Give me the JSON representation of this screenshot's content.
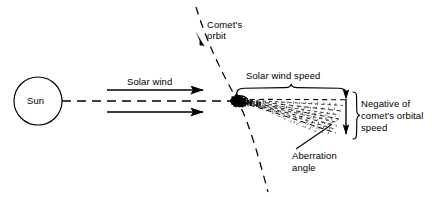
{
  "diagram": {
    "type": "schematic",
    "colors": {
      "ink": "#000000",
      "background": "#ffffff"
    },
    "labels": {
      "sun": "Sun",
      "solar_wind": "Solar wind",
      "comet_orbit_line1": "Comet's",
      "comet_orbit_line2": "orbit",
      "solar_wind_speed": "Solar wind speed",
      "negative_line1": "Negative of",
      "negative_line2": "comet's orbital",
      "negative_line3": "speed",
      "aberration_line1": "Aberration",
      "aberration_line2": "angle"
    },
    "elements": {
      "sun_circle": {
        "name": "sun-circle",
        "cx": 38,
        "cy": 101,
        "r": 24
      },
      "radial_dashed_line": {
        "name": "sun-comet-radial-line",
        "x1": 62,
        "y1": 101,
        "x2": 236,
        "y2": 101
      },
      "solar_wind_arrow_upper": {
        "name": "solar-wind-arrow-upper",
        "x1": 107,
        "y1": 90,
        "x2": 206,
        "y2": 90
      },
      "solar_wind_arrow_lower": {
        "name": "solar-wind-arrow-lower",
        "x1": 107,
        "y1": 112,
        "x2": 206,
        "y2": 112
      },
      "comet_orbit_curve": {
        "name": "comet-orbit-curve",
        "start": [
          196,
          7
        ],
        "through": [
          237,
          100
        ],
        "end": [
          268,
          192
        ]
      },
      "comet_orbit_arrowhead": {
        "name": "comet-orbit-arrowhead",
        "x": 197,
        "y": 34,
        "direction": "up-left"
      },
      "comet_nucleus": {
        "name": "comet-nucleus",
        "x": 238,
        "y": 100
      },
      "comet_tail": {
        "name": "comet-tail-wedge",
        "apex": [
          240,
          100
        ],
        "top_end": [
          346,
          100
        ],
        "bottom_end": [
          338,
          136
        ]
      },
      "solar_wind_speed_brace": {
        "name": "solar-wind-speed-brace",
        "x_start": 236,
        "x_end": 347,
        "y": 88
      },
      "negative_speed_arrow": {
        "name": "negative-speed-double-arrow",
        "x": 346,
        "y1": 95,
        "y2": 137
      },
      "negative_speed_brace": {
        "name": "negative-speed-brace",
        "x": 353,
        "y_start": 92,
        "y_end": 139
      },
      "aberration_leader": {
        "name": "aberration-angle-leader-line",
        "x1": 296,
        "y1": 148,
        "x2": 330,
        "y2": 126
      }
    }
  }
}
